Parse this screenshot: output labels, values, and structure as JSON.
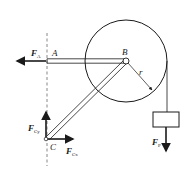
{
  "diagram": {
    "type": "statics free-body diagram",
    "points": {
      "A": {
        "label": "A"
      },
      "B": {
        "label": "B"
      },
      "C": {
        "label": "C"
      }
    },
    "radius_label": "r",
    "forces": {
      "FA": {
        "symbol": "F",
        "subscript": "A",
        "direction": "left"
      },
      "FCy": {
        "symbol": "F",
        "subscript": "Cy",
        "direction": "up"
      },
      "FCx": {
        "symbol": "F",
        "subscript": "Cx",
        "direction": "right"
      },
      "FP": {
        "symbol": "F",
        "subscript": "P",
        "direction": "down"
      }
    },
    "colors": {
      "stroke": "#1a1a1a",
      "background": "#ffffff"
    }
  }
}
